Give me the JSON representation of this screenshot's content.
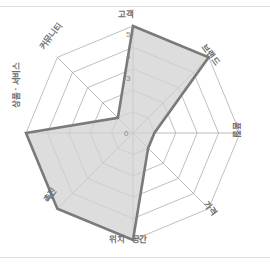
{
  "figure": {
    "background_color": "#ffffff",
    "rule_color": "#dcdcdc"
  },
  "chart_data": {
    "type": "radar",
    "title": "",
    "subtitle": "",
    "xlabel": "",
    "ylabel": "",
    "categories": [
      "고객",
      "브랜드",
      "품질",
      "가격",
      "위치 · 공간",
      "촉진",
      "상품 · 서비스",
      "커뮤니티"
    ],
    "values": [
      5,
      5,
      1,
      1,
      5,
      5,
      5,
      1
    ],
    "series": [
      {
        "name": "",
        "values": [
          5,
          5,
          1,
          1,
          5,
          5,
          5,
          1
        ]
      }
    ],
    "rlim": [
      0,
      5
    ],
    "tick_values": [
      0,
      1,
      2,
      3,
      4,
      5
    ],
    "tick_labels": [
      "0",
      "1",
      "2",
      "3",
      "4",
      "5"
    ],
    "visible_tick_labels": [
      "0",
      "3",
      "4",
      "5"
    ],
    "grid": true,
    "grid_rings": 5,
    "legend": false,
    "legend_position": "none",
    "fill_color": "#d2d2d2",
    "fill_opacity": 0.75,
    "line_color": "#7a7a7a",
    "line_width": 2.6,
    "grid_color": "#b0b0b0",
    "spoke_color": "#a8a8a8",
    "label_color": "#6e6e6e",
    "tick_color": "#8a8a8a"
  },
  "axis_labels": [
    {
      "text": "고객",
      "x": 118,
      "y": 10,
      "rotate": 0,
      "anchor": "start"
    },
    {
      "text": "브랜드",
      "x": 207,
      "y": 43,
      "rotate": 53,
      "anchor": "start"
    },
    {
      "text": "품질",
      "x": 241,
      "y": 122,
      "rotate": 90,
      "anchor": "start"
    },
    {
      "text": "가격",
      "x": 209,
      "y": 200,
      "rotate": 53,
      "anchor": "start"
    },
    {
      "text": "위치 · 공간",
      "x": 109,
      "y": 235,
      "rotate": 0,
      "anchor": "start"
    },
    {
      "text": "촉진",
      "x": 42,
      "y": 199,
      "rotate": -53,
      "anchor": "start"
    },
    {
      "text": "상품 · 서비스",
      "x": 12,
      "y": 108,
      "rotate": -90,
      "anchor": "start"
    },
    {
      "text": "커뮤니티",
      "x": 38,
      "y": 46,
      "rotate": -53,
      "anchor": "start"
    }
  ],
  "tick_text": [
    {
      "text": "5",
      "x": 126,
      "y": 31
    },
    {
      "text": "4",
      "x": 126,
      "y": 53
    },
    {
      "text": "3",
      "x": 126,
      "y": 75
    },
    {
      "text": "0",
      "x": 124,
      "y": 130
    }
  ]
}
